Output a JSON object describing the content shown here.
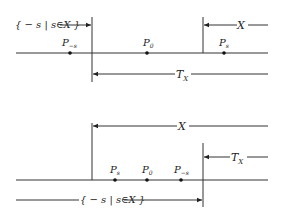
{
  "top_diagram": {
    "set_neg_label": "{ − s | s∈X }",
    "x_label": "X",
    "tx_label": "T",
    "tx_sub": "X",
    "points": [
      {
        "name": "P",
        "sub": "−s"
      },
      {
        "name": "P",
        "sub": "0"
      },
      {
        "name": "P",
        "sub": "s"
      }
    ]
  },
  "bottom_diagram": {
    "set_neg_label": "{ − s | s∈X }",
    "x_label": "X",
    "tx_label": "T",
    "tx_sub": "X",
    "points": [
      {
        "name": "P",
        "sub": "s"
      },
      {
        "name": "P",
        "sub": "0"
      },
      {
        "name": "P",
        "sub": "−s"
      }
    ]
  }
}
